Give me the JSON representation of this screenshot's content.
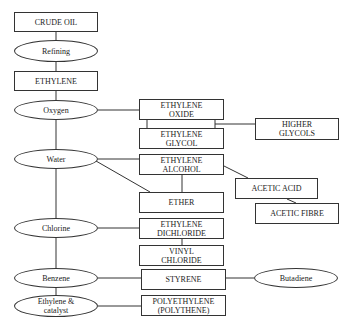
{
  "diagram": {
    "type": "flowchart",
    "colors": {
      "stroke": "#333333",
      "text": "#222222",
      "background": "#ffffff"
    },
    "nodes": {
      "crude_oil": {
        "label": "CRUDE OIL",
        "shape": "box"
      },
      "refining": {
        "label": "Refining",
        "shape": "ellipse"
      },
      "ethylene": {
        "label": "ETHYLENE",
        "shape": "box"
      },
      "oxygen": {
        "label": "Oxygen",
        "shape": "ellipse"
      },
      "ethylene_oxide": {
        "label": "ETHYLENE OXIDE",
        "shape": "box"
      },
      "ethylene_glycol": {
        "label": "ETHYLENE GLYCOL",
        "shape": "box"
      },
      "higher_glycols": {
        "label": "HIGHER GLYCOLS",
        "shape": "box"
      },
      "water": {
        "label": "Water",
        "shape": "ellipse"
      },
      "ethylene_alcohol": {
        "label": "ETHYLENE ALCOHOL",
        "shape": "box"
      },
      "acetic_acid": {
        "label": "ACETIC ACID",
        "shape": "box"
      },
      "acetic_fibre": {
        "label": "ACETIC FIBRE",
        "shape": "box"
      },
      "ether": {
        "label": "ETHER",
        "shape": "box"
      },
      "chlorine": {
        "label": "Chlorine",
        "shape": "ellipse"
      },
      "ethylene_dichloride": {
        "label": "ETHYLENE DICHLORIDE",
        "shape": "box"
      },
      "vinyl_chloride": {
        "label": "VINYL CHLORIDE",
        "shape": "box"
      },
      "benzene": {
        "label": "Benzene",
        "shape": "ellipse"
      },
      "styrene": {
        "label": "STYRENE",
        "shape": "box"
      },
      "butadiene": {
        "label": "Butadiene",
        "shape": "ellipse"
      },
      "ethylene_catalyst": {
        "label": "Ethylene & catalyst",
        "shape": "ellipse"
      },
      "polyethylene": {
        "label": "POLYETHYLENE (POLYTHENE)",
        "shape": "box"
      }
    },
    "edges": [
      [
        "crude_oil",
        "refining"
      ],
      [
        "refining",
        "ethylene"
      ],
      [
        "ethylene",
        "oxygen"
      ],
      [
        "oxygen",
        "ethylene_oxide"
      ],
      [
        "ethylene_oxide",
        "ethylene_glycol"
      ],
      [
        "ethylene_oxide",
        "higher_glycols"
      ],
      [
        "oxygen",
        "water"
      ],
      [
        "water",
        "ethylene_alcohol"
      ],
      [
        "water",
        "ether"
      ],
      [
        "ethylene_alcohol",
        "ether"
      ],
      [
        "ethylene_alcohol",
        "acetic_acid"
      ],
      [
        "acetic_acid",
        "acetic_fibre"
      ],
      [
        "water",
        "chlorine"
      ],
      [
        "chlorine",
        "ethylene_dichloride"
      ],
      [
        "ethylene_dichloride",
        "vinyl_chloride"
      ],
      [
        "chlorine",
        "benzene"
      ],
      [
        "benzene",
        "styrene"
      ],
      [
        "styrene",
        "butadiene"
      ],
      [
        "benzene",
        "ethylene_catalyst"
      ],
      [
        "ethylene_catalyst",
        "polyethylene"
      ]
    ]
  },
  "labels": {
    "crude_oil": "CRUDE OIL",
    "refining": "Refining",
    "ethylene": "ETHYLENE",
    "oxygen": "Oxygen",
    "ethylene_oxide_1": "ETHYLENE",
    "ethylene_oxide_2": "OXIDE",
    "ethylene_glycol_1": "ETHYLENE",
    "ethylene_glycol_2": "GLYCOL",
    "higher_glycols_1": "HIGHER",
    "higher_glycols_2": "GLYCOLS",
    "water": "Water",
    "ethylene_alcohol_1": "ETHYLENE",
    "ethylene_alcohol_2": "ALCOHOL",
    "acetic_acid": "ACETIC ACID",
    "acetic_fibre": "ACETIC FIBRE",
    "ether": "ETHER",
    "chlorine": "Chlorine",
    "ethylene_dichloride_1": "ETHYLENE",
    "ethylene_dichloride_2": "DICHLORIDE",
    "vinyl_chloride_1": "VINYL",
    "vinyl_chloride_2": "CHLORIDE",
    "benzene": "Benzene",
    "styrene": "STYRENE",
    "butadiene": "Butadiene",
    "ethylene_catalyst_1": "Ethylene &",
    "ethylene_catalyst_2": "catalyst",
    "polyethylene_1": "POLYETHYLENE",
    "polyethylene_2": "(POLYTHENE)"
  }
}
